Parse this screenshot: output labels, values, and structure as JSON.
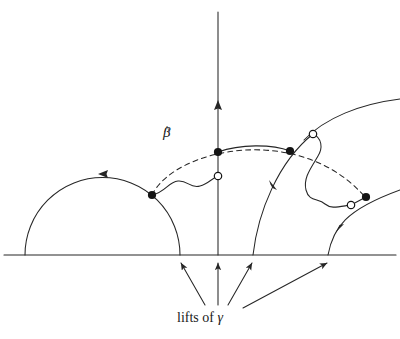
{
  "figure": {
    "kind": "hyperbolic-upper-half-plane-lift-diagram",
    "background_color": "#ffffff",
    "stroke_color": "#262626",
    "labels": {
      "beta_hat": "β",
      "beta_hat_accent": "^",
      "caption_prefix": "lifts of ",
      "caption_symbol": "γ",
      "caption_full": "lifts of γ"
    },
    "geometry": {
      "baseline_y": 255,
      "baseline_x_start": 4,
      "baseline_x_end": 396,
      "vertical_axis_x": 218,
      "vertical_axis_top": 12,
      "vertical_axis_arrow_y": 104,
      "left_semicircle": {
        "x_left": 25,
        "x_right": 180,
        "top_y": 178
      },
      "middle_arc": {
        "x_foot": 253,
        "top_x": 313,
        "top_y": 134
      },
      "right_arc": {
        "x_foot": 328,
        "exit_x": 400,
        "exit_y": 190
      },
      "far_arc": {
        "peak_x": 352,
        "exit_x": 400,
        "exit_y": 104
      },
      "dashed_arc": {
        "x_start": 152,
        "y_start": 195,
        "peak_y": 133,
        "x_end": 365,
        "y_end": 197
      }
    },
    "points": [
      {
        "name": "filled-dot-left",
        "type": "filled",
        "x": 152,
        "y": 195
      },
      {
        "name": "open-dot-center",
        "type": "open",
        "x": 218,
        "y": 176
      },
      {
        "name": "filled-dot-axis",
        "type": "filled",
        "x": 218,
        "y": 152
      },
      {
        "name": "filled-dot-mid-right",
        "type": "filled",
        "x": 290,
        "y": 151
      },
      {
        "name": "open-dot-upper-right",
        "type": "open",
        "x": 313,
        "y": 134
      },
      {
        "name": "open-dot-lower-right",
        "type": "open",
        "x": 351,
        "y": 205
      },
      {
        "name": "filled-dot-right",
        "type": "filled",
        "x": 366,
        "y": 197
      }
    ],
    "bottom_arrows": [
      {
        "name": "arrow-to-x180",
        "from_x": 205,
        "from_y": 305,
        "to_x": 180,
        "to_y": 262
      },
      {
        "name": "arrow-to-x218",
        "from_x": 218,
        "from_y": 305,
        "to_x": 218,
        "to_y": 262
      },
      {
        "name": "arrow-to-x253",
        "from_x": 228,
        "from_y": 305,
        "to_x": 253,
        "to_y": 262
      },
      {
        "name": "arrow-to-x328",
        "from_x": 243,
        "from_y": 308,
        "to_x": 328,
        "to_y": 262
      }
    ],
    "curve_arrowheads": [
      {
        "name": "arrowhead-left-semicircle",
        "x": 103,
        "y": 174,
        "direction": "left"
      },
      {
        "name": "arrowhead-vertical-axis",
        "x": 218,
        "y": 104,
        "direction": "up"
      },
      {
        "name": "arrowhead-middle-arc",
        "x": 272,
        "y": 185,
        "direction": "up-left"
      },
      {
        "name": "arrowhead-right-arc",
        "x": 340,
        "y": 228,
        "direction": "up-right"
      }
    ]
  }
}
